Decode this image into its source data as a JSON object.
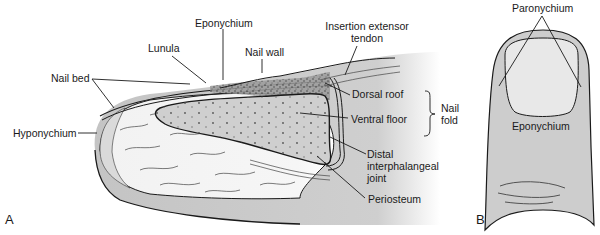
{
  "figure": {
    "panel_a": {
      "letter": "A",
      "labels": {
        "eponychium": "Eponychium",
        "lunula": "Lunula",
        "nail_wall": "Nail wall",
        "insertion_line1": "Insertion extensor",
        "insertion_line2": "tendon",
        "nail_bed": "Nail bed",
        "dorsal_roof": "Dorsal roof",
        "ventral_floor": "Ventral floor",
        "nail_fold_line1": "Nail",
        "nail_fold_line2": "fold",
        "hyponychium": "Hyponychium",
        "dip_line1": "Distal",
        "dip_line2": "interphalangeal",
        "dip_line3": "joint",
        "periosteum": "Periosteum"
      }
    },
    "panel_b": {
      "letter": "B",
      "labels": {
        "paronychium": "Paronychium",
        "eponychium": "Eponychium"
      }
    }
  },
  "colors": {
    "background": "#ffffff",
    "tissue_gray": "#c8c8c8",
    "light_gray": "#e6e6e6",
    "pulp_white": "#f4f4f4",
    "line": "#1a1a1a"
  }
}
